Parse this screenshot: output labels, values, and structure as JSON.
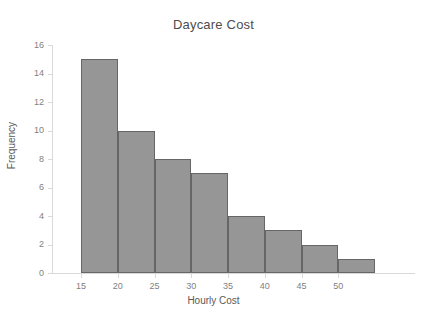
{
  "chart_data": {
    "type": "bar",
    "title": "Daycare Cost",
    "xlabel": "Hourly Cost",
    "ylabel": "Frequency",
    "categories": [
      "15-20",
      "20-25",
      "25-30",
      "30-35",
      "35-40",
      "40-45",
      "45-50",
      "50-55"
    ],
    "values": [
      15,
      10,
      8,
      7,
      4,
      3,
      2,
      1
    ],
    "bin_edges": [
      15,
      20,
      25,
      30,
      35,
      40,
      45,
      50,
      55
    ],
    "x_tick_labels": [
      "15",
      "20",
      "25",
      "30",
      "35",
      "40",
      "45",
      "50"
    ],
    "x_tick_values": [
      15,
      20,
      25,
      30,
      35,
      40,
      45,
      50
    ],
    "y_tick_labels": [
      "0",
      "2",
      "4",
      "6",
      "8",
      "10",
      "12",
      "14",
      "16"
    ],
    "y_tick_values": [
      0,
      2,
      4,
      6,
      8,
      10,
      12,
      14,
      16
    ],
    "xlim": [
      12.5,
      56
    ],
    "ylim": [
      0,
      16
    ],
    "grid": false,
    "legend": false,
    "bar_color": "#969696",
    "bar_border_color": "#666666",
    "axis_color": "#d9d9d9",
    "text_color": "#595959",
    "background": "#ffffff"
  }
}
